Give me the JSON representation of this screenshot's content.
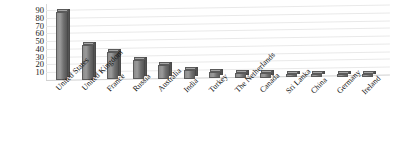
{
  "chart_data": {
    "type": "bar",
    "title": "",
    "xlabel": "",
    "ylabel": "",
    "ylim": [
      0,
      90
    ],
    "grid": true,
    "legend": "none",
    "style": "3d-column",
    "categories": [
      "United States",
      "United Kingdom",
      "France",
      "Russia",
      "Australia",
      "India",
      "Turkey",
      "The Netherlands",
      "Canada",
      "Sri Lanka",
      "China",
      "Germany",
      "Ireland"
    ],
    "values": [
      88,
      45,
      35,
      25,
      18,
      11,
      8,
      7,
      6,
      5,
      4,
      3,
      3
    ],
    "yticks": [
      90,
      80,
      70,
      60,
      50,
      40,
      30,
      20,
      10
    ],
    "bar_color": "#8d8d8d",
    "bar_side_color": "#545454",
    "bar_top_color": "#a5a5a5",
    "gridline_color": "#e9e9e9",
    "background_color": "#ffffff"
  }
}
